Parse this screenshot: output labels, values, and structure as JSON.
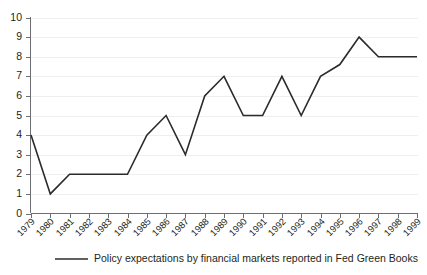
{
  "chart_data": {
    "type": "line",
    "title": "",
    "subtitle": "",
    "xlabel": "",
    "ylabel": "",
    "ylim": [
      0,
      10
    ],
    "ytick_step": 1,
    "grid": true,
    "legend_position": "bottom",
    "categories": [
      "1979",
      "1980",
      "1981",
      "1982",
      "1983",
      "1984",
      "1985",
      "1986",
      "1987",
      "1988",
      "1989",
      "1990",
      "1991",
      "1992",
      "1993",
      "1994",
      "1995",
      "1996",
      "1997",
      "1998",
      "1999"
    ],
    "yticks": [
      "0",
      "1",
      "2",
      "3",
      "4",
      "5",
      "6",
      "7",
      "8",
      "9",
      "10"
    ],
    "series": [
      {
        "name": "Policy expectations by financial markets reported in Fed Green Books",
        "color": "#2b2b2b",
        "values": [
          4,
          1,
          2,
          2,
          2,
          2,
          4,
          5,
          3,
          6,
          7,
          5,
          5,
          7,
          5,
          7,
          7.6,
          9,
          8,
          8,
          8
        ]
      }
    ]
  },
  "legend": {
    "entries": [
      {
        "label": "Policy expectations by financial markets reported in Fed Green Books"
      }
    ]
  },
  "colors": {
    "series": "#2b2b2b",
    "grid": "#efefef",
    "axis": "#6d6e71",
    "text": "#231f20",
    "background": "#ffffff"
  }
}
